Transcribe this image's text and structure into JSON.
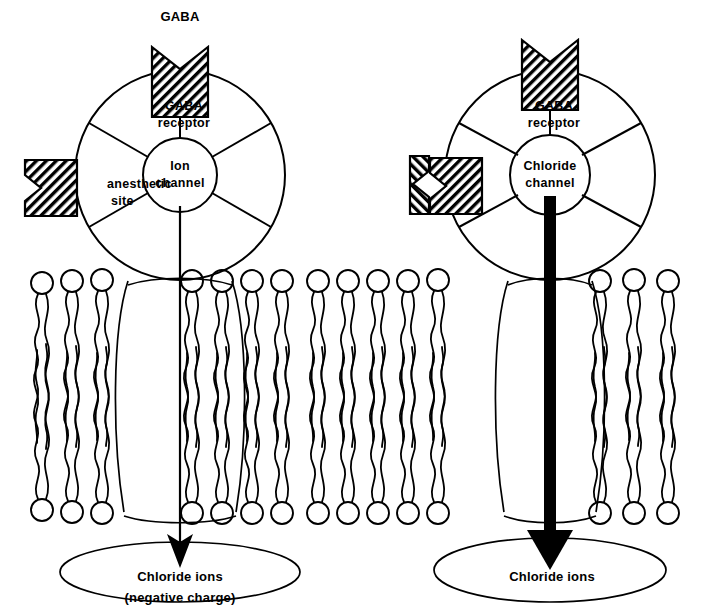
{
  "figure": {
    "background_color": "#ffffff",
    "ink_color": "#000000",
    "width": 706,
    "height": 612
  },
  "panels": [
    {
      "id": "left",
      "name": "unbound-anesthetic-panel",
      "ligand_label": "GABA",
      "receptor_label_line1": "GABA",
      "receptor_label_line2": "receptor",
      "site_label_line1": "anesthetic",
      "site_label_line2": "site",
      "channel_label_line1": "Ion",
      "channel_label_line2": "channel",
      "pool_label_line1": "Chloride ions",
      "pool_label_line2": "(negative charge)",
      "anesthetic_bound": "false",
      "flow_magnitude": "small"
    },
    {
      "id": "right",
      "name": "anesthetic-bound-panel",
      "ligand_label": "",
      "receptor_label_line1": "GABA",
      "receptor_label_line2": "receptor",
      "site_label_line1": "",
      "site_label_line2": "",
      "channel_label_line1": "Chloride",
      "channel_label_line2": "channel",
      "pool_label_line1": "Chloride ions",
      "pool_label_line2": "",
      "anesthetic_bound": "true",
      "flow_magnitude": "large"
    }
  ],
  "membrane": {
    "name": "phospholipid-bilayer",
    "upper_leaflet_y": 277,
    "lower_leaflet_y": 513,
    "head_radius": 11
  },
  "icons": {
    "gaba_molecule": "gaba-molecule-icon",
    "anesthetic_site": "anesthetic-site-icon",
    "anesthetic_drug": "anesthetic-drug-icon",
    "flow_arrow": "downward-arrow-icon"
  }
}
